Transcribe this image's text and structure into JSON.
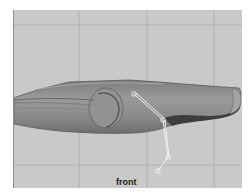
{
  "viewport": {
    "camera_label": "front",
    "background_color": "#c9c9c9",
    "grid_color": "#b2b2b2",
    "mesh_color": "#8c8c8c",
    "mesh_dark_color": "#4a4a4a",
    "joint_color": "#f2f2f2",
    "joints": [
      {
        "name": "joint-1",
        "x": 120,
        "y": 84
      },
      {
        "name": "joint-2",
        "x": 149,
        "y": 110
      },
      {
        "name": "joint-3",
        "x": 154,
        "y": 147
      },
      {
        "name": "joint-4",
        "x": 144,
        "y": 161
      }
    ]
  }
}
